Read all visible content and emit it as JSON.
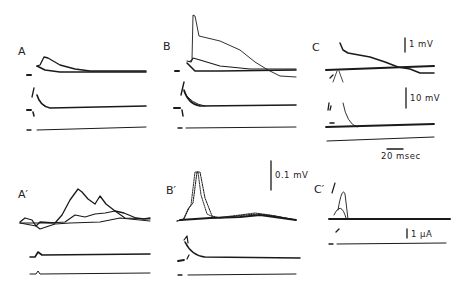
{
  "figure": {
    "panels": [
      {
        "id": "A",
        "label": "A"
      },
      {
        "id": "B",
        "label": "B"
      },
      {
        "id": "C",
        "label": "C"
      },
      {
        "id": "A_prime",
        "label": "A′"
      },
      {
        "id": "B_prime",
        "label": "B′"
      },
      {
        "id": "C_prime",
        "label": "C′"
      }
    ],
    "scale_bars": {
      "voltage_1mV": "1 mV",
      "voltage_10mV": "10 mV",
      "time_20ms": "20 msec",
      "voltage_0_1mV": "0.1 mV",
      "current_1uA": "1 µA"
    }
  }
}
